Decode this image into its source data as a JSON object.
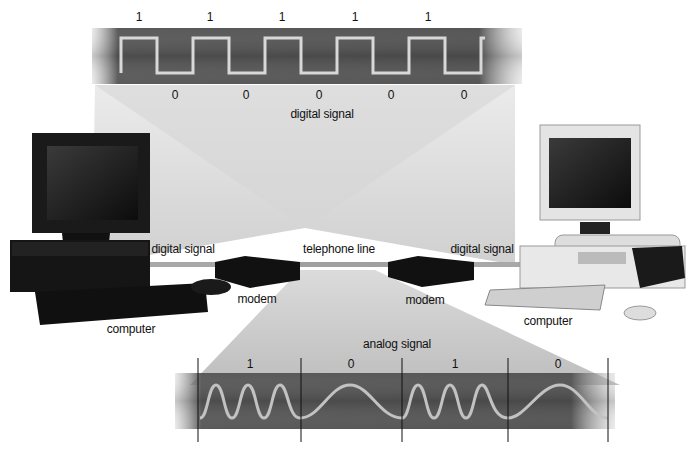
{
  "digital_panel": {
    "ones": [
      "1",
      "1",
      "1",
      "1",
      "1"
    ],
    "zeros": [
      "0",
      "0",
      "0",
      "0",
      "0"
    ],
    "caption": "digital signal",
    "bits_sequence": "1010101010"
  },
  "link_labels": {
    "left_digital": "digital signal",
    "telephone_line": "telephone line",
    "right_digital": "digital signal"
  },
  "devices": {
    "left_computer": "computer",
    "left_modem": "modem",
    "right_modem": "modem",
    "right_computer": "computer"
  },
  "analog_panel": {
    "caption": "analog signal",
    "bits": [
      "1",
      "0",
      "1",
      "0"
    ]
  },
  "colors": {
    "band_dark": "#4a4a4a",
    "wave": "#bdbdbd",
    "beam": "#d9d9d9",
    "cable": "#9a9a9a"
  }
}
